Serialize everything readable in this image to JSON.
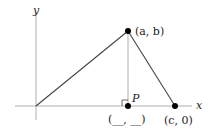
{
  "diagram": {
    "axes": {
      "x_label": "x",
      "y_label": "y"
    },
    "points": {
      "apex": {
        "label": "(a, b)"
      },
      "foot": {
        "name": "P",
        "label": "(__, __)"
      },
      "base_end": {
        "label": "(c, 0)"
      }
    },
    "colors": {
      "axis": "#aaaaaa",
      "triangle": "#333333",
      "altitude": "#888888",
      "point": "#000000"
    }
  }
}
